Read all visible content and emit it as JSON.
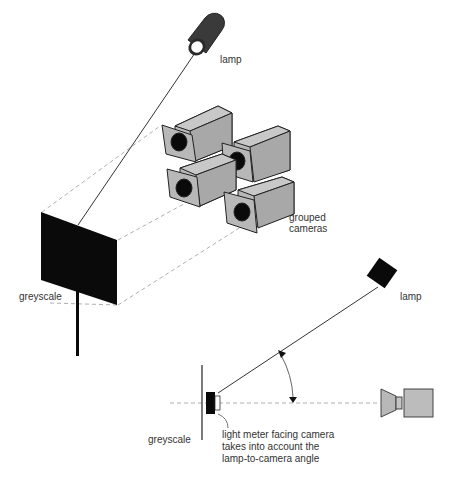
{
  "diagram": {
    "top": {
      "lamp_label": "lamp",
      "cameras_label_line1": "grouped",
      "cameras_label_line2": "cameras",
      "greyscale_label": "greyscale"
    },
    "bottom": {
      "lamp_label": "lamp",
      "greyscale_label": "greyscale",
      "note_line1": "light meter facing camera",
      "note_line2": "takes into account the",
      "note_line3": "lamp-to-camera angle"
    },
    "colors": {
      "camera_fill": "#b8b8b8",
      "dark": "#0a0a0a",
      "line": "#333333",
      "dashed": "#999999"
    }
  }
}
